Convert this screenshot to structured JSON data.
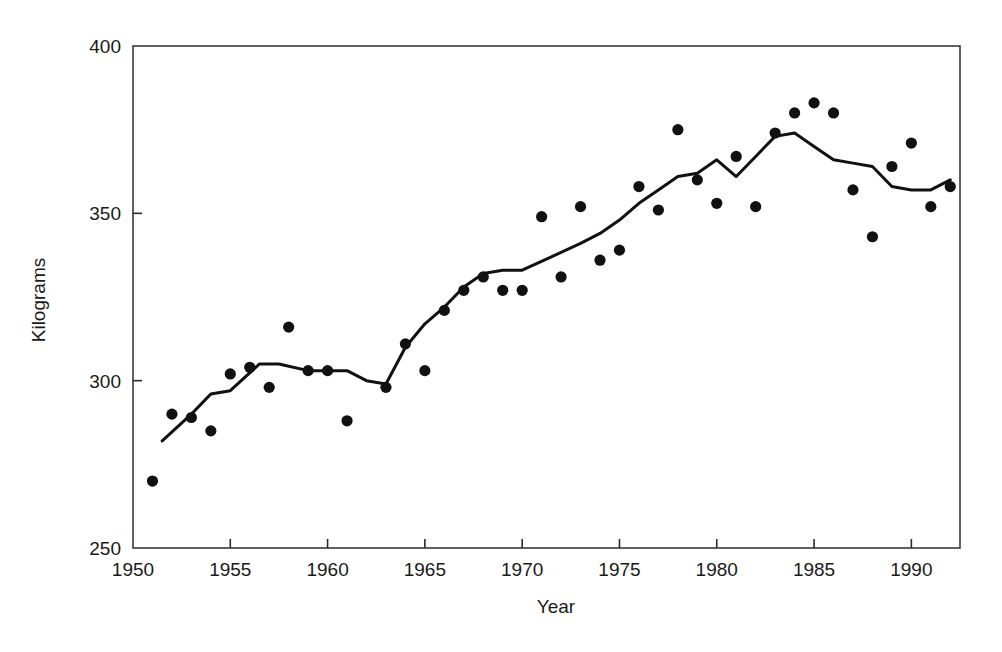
{
  "chart_data": {
    "type": "scatter",
    "title": "",
    "xlabel": "Year",
    "ylabel": "Kilograms",
    "xlim": [
      1950,
      1992.5
    ],
    "ylim": [
      250,
      400
    ],
    "xticks": [
      1950,
      1955,
      1960,
      1965,
      1970,
      1975,
      1980,
      1985,
      1990
    ],
    "xtick_labels": [
      "1950",
      "1955",
      "1960",
      "1965",
      "1970",
      "1975",
      "1980",
      "1985",
      "1990"
    ],
    "yticks": [
      250,
      300,
      350,
      400
    ],
    "ytick_labels": [
      "250",
      "300",
      "350",
      "400"
    ],
    "grid": false,
    "legend": "none",
    "frame": "box",
    "marker": "filled-circle",
    "marker_color": "#111111",
    "line_color": "#111111",
    "series": [
      {
        "name": "Observations",
        "type": "scatter",
        "x": [
          1951,
          1952,
          1953,
          1954,
          1955,
          1956,
          1957,
          1958,
          1959,
          1960,
          1961,
          1963,
          1964,
          1965,
          1966,
          1967,
          1968,
          1969,
          1970,
          1971,
          1972,
          1973,
          1974,
          1975,
          1976,
          1977,
          1978,
          1979,
          1980,
          1981,
          1982,
          1983,
          1984,
          1985,
          1986,
          1987,
          1988,
          1989,
          1990,
          1991,
          1992
        ],
        "y": [
          270,
          290,
          289,
          285,
          302,
          304,
          298,
          316,
          303,
          303,
          288,
          298,
          311,
          303,
          321,
          327,
          331,
          327,
          327,
          349,
          331,
          352,
          336,
          339,
          358,
          351,
          375,
          360,
          353,
          367,
          352,
          374,
          380,
          383,
          380,
          357,
          343,
          364,
          371,
          352,
          358
        ]
      },
      {
        "name": "Trend",
        "type": "line",
        "x": [
          1951.5,
          1953,
          1954,
          1955,
          1956.5,
          1957.5,
          1959,
          1960,
          1961,
          1962,
          1963,
          1964,
          1965,
          1966,
          1967,
          1968,
          1969,
          1970,
          1971.5,
          1973,
          1974,
          1975,
          1976,
          1977,
          1978,
          1979,
          1980,
          1981,
          1982,
          1983,
          1984,
          1985,
          1986,
          1987,
          1988,
          1989,
          1990,
          1991,
          1992
        ],
        "y": [
          282,
          290,
          296,
          297,
          305,
          305,
          303,
          303,
          303,
          300,
          299,
          310,
          317,
          322,
          328,
          332,
          333,
          333,
          337,
          341,
          344,
          348,
          353,
          357,
          361,
          362,
          366,
          361,
          367,
          373,
          374,
          370,
          366,
          365,
          364,
          358,
          357,
          357,
          360
        ]
      }
    ]
  },
  "axes": {
    "ylabel_text": "Kilograms",
    "xlabel_text": "Year"
  }
}
